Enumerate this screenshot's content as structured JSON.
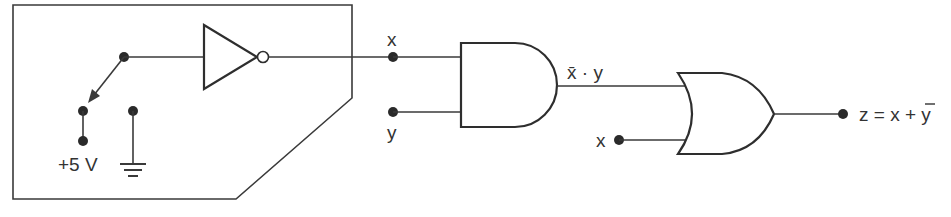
{
  "diagram": {
    "type": "logic-circuit",
    "switch_box": {
      "supply_label": "+5 V",
      "ground_symbol": "ground-icon",
      "inverter": "NOT gate"
    },
    "nodes": {
      "x_label_top": "x",
      "y_label": "y",
      "x_label_or_input": "x"
    },
    "gates": [
      {
        "type": "NOT",
        "output": "x"
      },
      {
        "type": "AND",
        "inputs": [
          "x",
          "y"
        ],
        "output_label": "x̄ · y"
      },
      {
        "type": "OR",
        "inputs": [
          "x̄ · y",
          "x"
        ],
        "output_label": "z = x + ȳ"
      }
    ],
    "labels": {
      "and_output": "x̄ · y",
      "or_output_z": "z = x + ",
      "or_output_ybar": "y"
    }
  }
}
